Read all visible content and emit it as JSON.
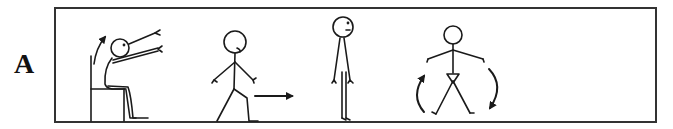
{
  "figure": {
    "panel_label": "A",
    "colors": {
      "stroke": "#1a1a1a",
      "background": "#ffffff",
      "frame": "#333333"
    },
    "scenes": [
      {
        "id": "seated-arm-raise",
        "description": "Seated figure on chair raising both arms forward and up, curved arrow indicating upward motion"
      },
      {
        "id": "walking",
        "description": "Stick figure walking with arrow pointing right"
      },
      {
        "id": "standing",
        "description": "Stick figure standing upright, side view"
      },
      {
        "id": "standing-rotation",
        "description": "Stick figure standing facing forward with arms out and curved arrows on both sides"
      }
    ]
  }
}
